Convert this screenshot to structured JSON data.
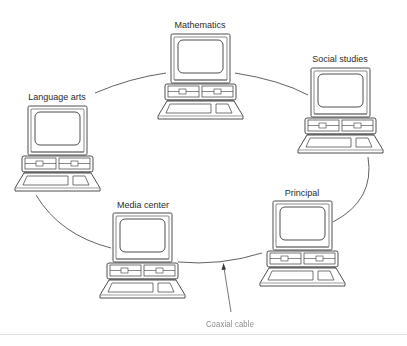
{
  "diagram": {
    "type": "ring network",
    "nodes": [
      {
        "id": "mathematics",
        "label": "Mathematics",
        "x": 200,
        "y": 26
      },
      {
        "id": "social-studies",
        "label": "Social studies",
        "x": 340,
        "y": 60
      },
      {
        "id": "principal",
        "label": "Principal",
        "x": 302,
        "y": 194
      },
      {
        "id": "media-center",
        "label": "Media center",
        "x": 143,
        "y": 206
      },
      {
        "id": "language-arts",
        "label": "Language arts",
        "x": 57,
        "y": 98
      }
    ],
    "edges": [
      [
        "mathematics",
        "social-studies"
      ],
      [
        "social-studies",
        "principal"
      ],
      [
        "principal",
        "media-center"
      ],
      [
        "media-center",
        "language-arts"
      ],
      [
        "language-arts",
        "mathematics"
      ]
    ],
    "annotation": {
      "label": "Coaxial cable",
      "points_to": "cable between Media center and Principal"
    }
  },
  "colors": {
    "line": "#3a3a3a",
    "text": "#2a2a2a",
    "faded_text": "#8a8a8a",
    "background": "#ffffff"
  }
}
